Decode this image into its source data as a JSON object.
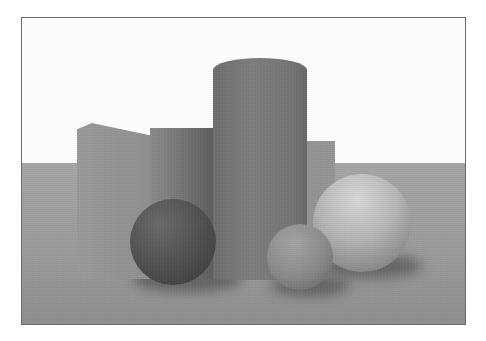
{
  "scene": {
    "description": "Path-traced grayscale render of geometric primitives on a plane",
    "background": {
      "sky_color": "#ffffff",
      "floor_color": "#9c9c9c",
      "horizon_y": 162
    },
    "frame": {
      "x": 21,
      "y": 17,
      "width": 445,
      "height": 308,
      "border_color": "#6a6a6a"
    },
    "objects": [
      {
        "name": "left-box",
        "shape": "box",
        "color": "#929292"
      },
      {
        "name": "back-box",
        "shape": "box",
        "color": "#959595"
      },
      {
        "name": "tall-cylinder",
        "shape": "cylinder",
        "color": "#787878"
      },
      {
        "name": "dark-sphere",
        "shape": "sphere",
        "color": "#4c4c4c"
      },
      {
        "name": "small-sphere",
        "shape": "sphere",
        "color": "#8a8a8a"
      },
      {
        "name": "large-sphere",
        "shape": "sphere",
        "color": "#b5b5b5"
      }
    ]
  }
}
